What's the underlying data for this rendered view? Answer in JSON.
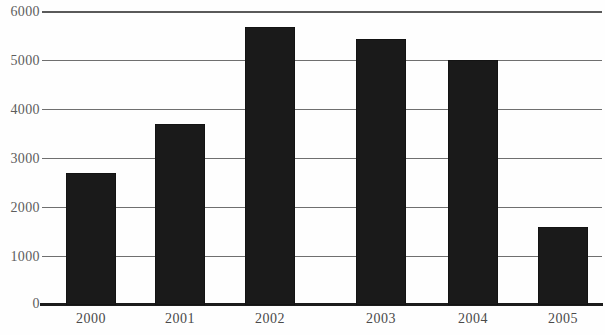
{
  "chart_data": {
    "type": "bar",
    "title": "",
    "subtitle": "",
    "xlabel": "",
    "ylabel": "",
    "categories": [
      "2000",
      "2001",
      "2002",
      "2003",
      "2004",
      "2005"
    ],
    "values": [
      2700,
      3700,
      5680,
      5420,
      5000,
      1600
    ],
    "series": [
      {
        "name": "",
        "values": [
          2700,
          3700,
          5680,
          5420,
          5000,
          1600
        ]
      }
    ],
    "ylim": [
      0,
      6000
    ],
    "y_ticks": [
      0,
      1000,
      2000,
      3000,
      4000,
      5000,
      6000
    ],
    "y_tick_labels": [
      "0",
      "1000",
      "2000",
      "3000",
      "4000",
      "5000",
      "6000"
    ],
    "x_tick_labels": [
      "2000",
      "2001",
      "2002",
      "2003",
      "2004",
      "2005"
    ],
    "grid": true,
    "grid_axis": "y",
    "legend": false,
    "legend_position": "none",
    "bar_color": "#1a1a1a",
    "gridline_color": "#6f6f6f",
    "axis_color": "#1c1c1c",
    "tick_label_color": "#5d5d5d",
    "background_color": "#fefefe"
  }
}
